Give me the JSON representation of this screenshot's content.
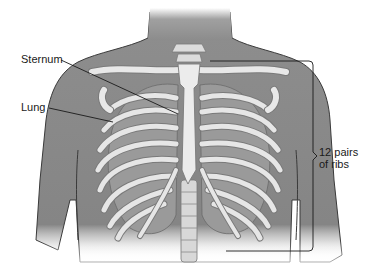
{
  "figure": {
    "labels": {
      "sternum": "Sternum",
      "lung": "Lung",
      "ribs_line1": "12 pairs",
      "ribs_line2": "of ribs"
    }
  },
  "colors": {
    "background": "#ffffff",
    "skin": "#8a8a8a",
    "skin_dark": "#6e6e6e",
    "skin_outline": "#3a3a3a",
    "bone": "#e6e6e6",
    "bone_outline": "#7a7a7a",
    "lung": "#9a9a9a",
    "leader_line": "#1a1a1a"
  }
}
